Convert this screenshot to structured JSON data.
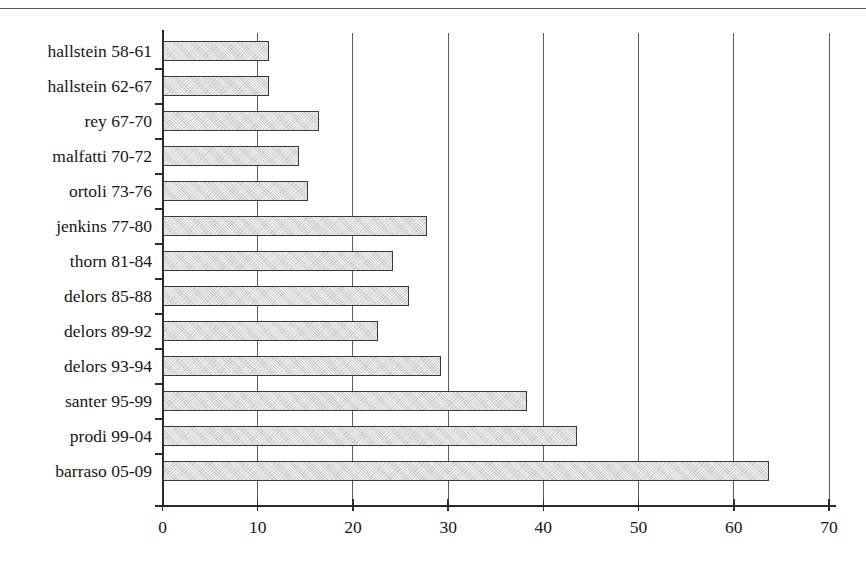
{
  "chart_data": {
    "type": "bar",
    "orientation": "horizontal",
    "title": "",
    "subtitle": "",
    "xlabel": "",
    "ylabel": "",
    "xlim": [
      0,
      70
    ],
    "xticks": [
      0,
      10,
      20,
      30,
      40,
      50,
      60,
      70
    ],
    "xtick_labels": [
      "0",
      "10",
      "20",
      "30",
      "40",
      "50",
      "60",
      "70"
    ],
    "grid": "vertical",
    "legend": "none",
    "categories": [
      "hallstein 58-61",
      "hallstein 62-67",
      "rey 67-70",
      "malfatti 70-72",
      "ortoli 73-76",
      "jenkins 77-80",
      "thorn 81-84",
      "delors 85-88",
      "delors 89-92",
      "delors 93-94",
      "santer 95-99",
      "prodi 99-04",
      "barraso 05-09"
    ],
    "values": [
      11.2,
      11.2,
      16.4,
      14.3,
      15.3,
      27.8,
      24.2,
      25.9,
      22.6,
      29.2,
      38.3,
      43.5,
      63.7
    ],
    "bar_fill_color": "#d9d9d9",
    "bar_border_color": "#3a3a3a",
    "gridline_color": "#5e5e5e",
    "axis_color": "#2b2b2b"
  }
}
